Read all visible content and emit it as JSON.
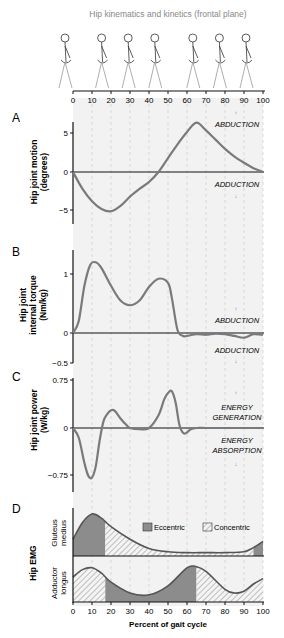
{
  "title": "Hip kinematics and kinetics (frontal plane)",
  "x_ticks": [
    0,
    10,
    20,
    30,
    40,
    50,
    60,
    70,
    80,
    90,
    100
  ],
  "xlabel": "Percent of gait cycle",
  "colors": {
    "curve": "#7a7a7a",
    "axis": "#111111",
    "bg": "#f2f2f2",
    "fill": "#8c8c8c",
    "grid": "#c8c8c8"
  },
  "chart_data": [
    {
      "panel": "A",
      "type": "line",
      "title": "Hip joint motion",
      "ylabel": "Hip joint motion (degrees)",
      "ylim": [
        -6.5,
        6.5
      ],
      "yticks": [
        5,
        0,
        -5
      ],
      "annotations": [
        "ABDUCTION",
        "ADDUCTION"
      ],
      "x": [
        0,
        5,
        10,
        15,
        20,
        25,
        30,
        35,
        40,
        45,
        50,
        55,
        60,
        65,
        70,
        75,
        80,
        85,
        90,
        95,
        100
      ],
      "y": [
        0,
        -2.2,
        -3.8,
        -4.8,
        -5.1,
        -4.4,
        -3.2,
        -2.2,
        -1.3,
        0,
        1.8,
        3.6,
        5.2,
        6.4,
        5.4,
        4.2,
        3.0,
        2.0,
        1.2,
        0.5,
        0
      ]
    },
    {
      "panel": "B",
      "type": "line",
      "title": "Hip joint internal torque",
      "ylabel": "Hip joint internal torque (Nm/kg)",
      "ylim": [
        -0.5,
        1.4
      ],
      "yticks": [
        1,
        0,
        -0.5
      ],
      "annotations": [
        "ABDUCTION",
        "ADDUCTION"
      ],
      "x": [
        0,
        3,
        6,
        9,
        12,
        15,
        20,
        25,
        30,
        35,
        40,
        45,
        50,
        52,
        55,
        58,
        60,
        65,
        70,
        75,
        80,
        85,
        90,
        95,
        100
      ],
      "y": [
        0,
        0.2,
        0.8,
        1.15,
        1.2,
        1.1,
        0.8,
        0.55,
        0.47,
        0.55,
        0.78,
        0.92,
        0.85,
        0.6,
        0.05,
        -0.05,
        -0.05,
        -0.02,
        -0.03,
        -0.01,
        -0.02,
        -0.05,
        -0.08,
        -0.02,
        -0.03
      ]
    },
    {
      "panel": "C",
      "type": "line",
      "title": "Hip joint power",
      "ylabel": "Hip joint power (W/kg)",
      "ylim": [
        -0.9,
        0.75
      ],
      "yticks": [
        0.75,
        0,
        -0.75
      ],
      "annotations": [
        "ENERGY GENERATION",
        "ENERGY ABSORPTION"
      ],
      "x": [
        0,
        3,
        6,
        8,
        10,
        12,
        14,
        16,
        18,
        20,
        22,
        25,
        28,
        30,
        35,
        40,
        45,
        48,
        50,
        52,
        54,
        56,
        58,
        60,
        62,
        65,
        70,
        80,
        90,
        100
      ],
      "y": [
        0,
        -0.15,
        -0.55,
        -0.75,
        -0.78,
        -0.6,
        -0.2,
        0.1,
        0.22,
        0.28,
        0.27,
        0.15,
        0.05,
        0,
        -0.02,
        0,
        0.2,
        0.45,
        0.55,
        0.58,
        0.4,
        0.05,
        -0.08,
        -0.07,
        -0.02,
        0,
        0,
        0,
        0,
        0
      ]
    },
    {
      "panel": "D",
      "type": "area",
      "title": "Hip EMG",
      "legend": [
        "Eccentric",
        "Concentric"
      ],
      "series": [
        {
          "name": "Gluteus medius",
          "x": [
            0,
            5,
            10,
            15,
            20,
            30,
            40,
            50,
            60,
            70,
            80,
            90,
            95,
            100
          ],
          "y": [
            0.4,
            0.8,
            1.0,
            0.9,
            0.7,
            0.4,
            0.18,
            0.1,
            0.08,
            0.08,
            0.08,
            0.1,
            0.2,
            0.35
          ],
          "phases": [
            {
              "type": "Eccentric",
              "from": 0,
              "to": 17
            },
            {
              "type": "Concentric",
              "from": 17,
              "to": 95
            },
            {
              "type": "Eccentric",
              "from": 95,
              "to": 100
            }
          ]
        },
        {
          "name": "Adductor longus",
          "x": [
            0,
            5,
            10,
            15,
            20,
            30,
            40,
            50,
            60,
            65,
            70,
            80,
            85,
            90,
            95,
            100
          ],
          "y": [
            0.7,
            0.9,
            0.95,
            0.8,
            0.55,
            0.25,
            0.2,
            0.45,
            0.95,
            0.98,
            0.85,
            0.35,
            0.25,
            0.3,
            0.5,
            0.65
          ],
          "phases": [
            {
              "type": "Concentric",
              "from": 0,
              "to": 17
            },
            {
              "type": "Eccentric",
              "from": 17,
              "to": 65
            },
            {
              "type": "Concentric",
              "from": 65,
              "to": 100
            }
          ]
        }
      ]
    }
  ],
  "labels": {
    "A": "A",
    "B": "B",
    "C": "C",
    "D": "D",
    "a_y1": "Hip joint motion",
    "a_y2": "(degrees)",
    "b_y1": "Hip joint",
    "b_y2": "internal torque",
    "b_y3": "(Nm/kg)",
    "c_y1": "Hip joint power",
    "c_y2": "(W/kg)",
    "d_y": "Hip EMG",
    "d_glut1": "Gluteus",
    "d_glut2": "medius",
    "d_add1": "Adductor",
    "d_add2": "longus",
    "abd": "ABDUCTION",
    "add": "ADDUCTION",
    "gen1": "ENERGY",
    "gen2": "GENERATION",
    "abs1": "ENERGY",
    "abs2": "ABSORPTION",
    "ecc": "Eccentric",
    "con": "Concentric",
    "a_t5": "5",
    "a_t0": "0",
    "a_tm5": "−5",
    "b_t1": "1",
    "b_t0": "0",
    "b_tm": "−0.5",
    "c_t1": "0.75",
    "c_t0": "0",
    "c_tm": "−0.75"
  }
}
